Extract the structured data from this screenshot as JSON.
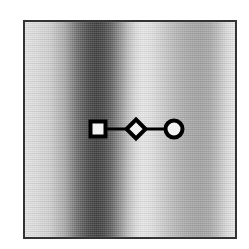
{
  "figure": {
    "canvas": {
      "width": 249,
      "height": 249,
      "background": "#ffffff"
    },
    "panel": {
      "name": "plot-panel",
      "left": 23,
      "top": 20,
      "width": 214,
      "height": 219,
      "border_color": "#333333",
      "border_width": 2
    }
  },
  "chart_data": {
    "type": "line",
    "title": "",
    "subtitle": "",
    "xlabel": "",
    "ylabel": "",
    "grid": false,
    "legend": "none",
    "axis_ticks": [],
    "tick_labels": [],
    "xlim": [
      0,
      1
    ],
    "ylim": [
      0,
      1
    ],
    "background": {
      "type": "heatmap",
      "description": "horizontal grayscale gradient with vertical bands",
      "orientation": "horizontal",
      "colormap": "grayscale",
      "stops": [
        {
          "position": 0.0,
          "color": "#e2e2e2",
          "gray": 226
        },
        {
          "position": 0.05,
          "color": "#dcdcdc",
          "gray": 220
        },
        {
          "position": 0.12,
          "color": "#cfcfcf",
          "gray": 207
        },
        {
          "position": 0.19,
          "color": "#a8a8a8",
          "gray": 168
        },
        {
          "position": 0.25,
          "color": "#6d6d6d",
          "gray": 109
        },
        {
          "position": 0.3,
          "color": "#4a4a4a",
          "gray": 74
        },
        {
          "position": 0.34,
          "color": "#3e3e3e",
          "gray": 62
        },
        {
          "position": 0.37,
          "color": "#454545",
          "gray": 69
        },
        {
          "position": 0.41,
          "color": "#606060",
          "gray": 96
        },
        {
          "position": 0.45,
          "color": "#8e8e8e",
          "gray": 142
        },
        {
          "position": 0.49,
          "color": "#bcbcbc",
          "gray": 188
        },
        {
          "position": 0.53,
          "color": "#dcdcdc",
          "gray": 220
        },
        {
          "position": 0.56,
          "color": "#e6e6e6",
          "gray": 230
        },
        {
          "position": 0.6,
          "color": "#e0e0e0",
          "gray": 224
        },
        {
          "position": 0.64,
          "color": "#d2d2d2",
          "gray": 210
        },
        {
          "position": 0.68,
          "color": "#c3c3c3",
          "gray": 195
        },
        {
          "position": 0.72,
          "color": "#b6b6b6",
          "gray": 182
        },
        {
          "position": 0.76,
          "color": "#ababab",
          "gray": 171
        },
        {
          "position": 0.8,
          "color": "#a4a4a4",
          "gray": 164
        },
        {
          "position": 0.84,
          "color": "#a2a2a2",
          "gray": 162
        },
        {
          "position": 0.88,
          "color": "#a8a8a8",
          "gray": 168
        },
        {
          "position": 0.92,
          "color": "#bcbcbc",
          "gray": 188
        },
        {
          "position": 0.96,
          "color": "#d8d8d8",
          "gray": 216
        },
        {
          "position": 1.0,
          "color": "#e8e8e8",
          "gray": 232
        }
      ]
    },
    "series": [
      {
        "name": "overlay-polyline",
        "line_color": "#000000",
        "line_width": 3,
        "marker_fill": "#f2f2f2",
        "marker_edge": "#000000",
        "points": [
          {
            "index": 0,
            "marker": "square",
            "x": 0.35,
            "y": 0.498,
            "px_x": 98,
            "px_y": 129,
            "size": 15
          },
          {
            "index": 1,
            "marker": "diamond",
            "x": 0.528,
            "y": 0.498,
            "px_x": 136,
            "px_y": 129,
            "size": 19
          },
          {
            "index": 2,
            "marker": "circle",
            "x": 0.707,
            "y": 0.498,
            "px_x": 174,
            "px_y": 129,
            "size": 17
          }
        ]
      }
    ]
  }
}
